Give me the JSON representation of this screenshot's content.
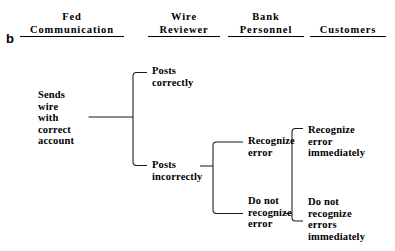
{
  "figure": {
    "panel_label": "b",
    "type": "decision-tree",
    "orientation": "left-to-right",
    "background_color": "#ffffff",
    "line_color": "#1a1a1a",
    "text_color": "#000000"
  },
  "columns": [
    {
      "id": "fed",
      "line1": "Fed",
      "line2": "Communication"
    },
    {
      "id": "wire",
      "line1": "Wire",
      "line2": "Reviewer"
    },
    {
      "id": "bank",
      "line1": "Bank",
      "line2": "Personnel"
    },
    {
      "id": "customers",
      "line1": "",
      "line2": "Customers"
    }
  ],
  "nodes": {
    "sends_wire": {
      "id": "sends-wire-with-correct-account",
      "column": "fed",
      "lines": [
        "Sends",
        "wire",
        "with",
        "correct",
        "account"
      ]
    },
    "posts_correctly": {
      "id": "posts-correctly",
      "column": "wire",
      "lines": [
        "Posts",
        "correctly"
      ]
    },
    "posts_incorrectly": {
      "id": "posts-incorrectly",
      "column": "wire",
      "lines": [
        "Posts",
        "incorrectly"
      ]
    },
    "recognize_error": {
      "id": "recognize-error",
      "column": "bank",
      "lines": [
        "Recognize",
        "error"
      ]
    },
    "do_not_recognize_error": {
      "id": "do-not-recognize-error",
      "column": "bank",
      "lines": [
        "Do not",
        "recognize",
        "error"
      ]
    },
    "recognize_error_immediately": {
      "id": "recognize-error-immediately",
      "column": "customers",
      "lines": [
        "Recognize",
        "error",
        "immediately"
      ]
    },
    "do_not_recognize_errors_immediately": {
      "id": "do-not-recognize-errors-immediately",
      "column": "customers",
      "lines": [
        "Do not",
        "recognize",
        "errors",
        "immediately"
      ]
    }
  },
  "edges": [
    {
      "from": "sends_wire",
      "to": "posts_correctly"
    },
    {
      "from": "sends_wire",
      "to": "posts_incorrectly"
    },
    {
      "from": "posts_incorrectly",
      "to": "recognize_error"
    },
    {
      "from": "posts_incorrectly",
      "to": "do_not_recognize_error"
    },
    {
      "from": "do_not_recognize_error",
      "to": "recognize_error_immediately"
    },
    {
      "from": "do_not_recognize_error",
      "to": "do_not_recognize_errors_immediately"
    }
  ]
}
